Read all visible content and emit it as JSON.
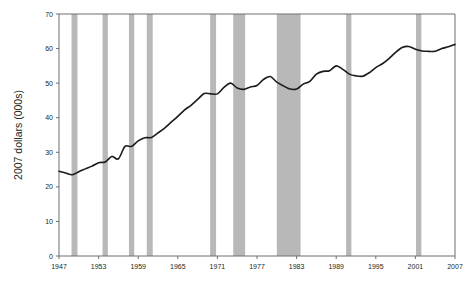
{
  "chart_data": {
    "type": "line",
    "title": "",
    "subtitle": "",
    "xlabel": "",
    "ylabel": "2007 dollars (000s)",
    "xlim": [
      1947,
      2007
    ],
    "ylim": [
      0,
      70
    ],
    "ytick_labels": [
      "0",
      "10",
      "20",
      "30",
      "40",
      "50",
      "60",
      "70"
    ],
    "yticks": [
      0,
      10,
      20,
      30,
      40,
      50,
      60,
      70
    ],
    "xtick_labels": [
      "1947",
      "1953",
      "1959",
      "1965",
      "1971",
      "1977",
      "1983",
      "1989",
      "1995",
      "2001",
      "2007"
    ],
    "xticks": [
      1947,
      1953,
      1959,
      1965,
      1971,
      1977,
      1983,
      1989,
      1995,
      2001,
      2007
    ],
    "grid": false,
    "legend": null,
    "line_color": "#1a1a1a",
    "band_color": "#b8b8b8",
    "axis_color": "#6d6e71",
    "series": [
      {
        "name": "Median household income",
        "x": [
          1947,
          1948,
          1949,
          1950,
          1951,
          1952,
          1953,
          1954,
          1955,
          1956,
          1957,
          1958,
          1959,
          1960,
          1961,
          1962,
          1963,
          1964,
          1965,
          1966,
          1967,
          1968,
          1969,
          1970,
          1971,
          1972,
          1973,
          1974,
          1975,
          1976,
          1977,
          1978,
          1979,
          1980,
          1981,
          1982,
          1983,
          1984,
          1985,
          1986,
          1987,
          1988,
          1989,
          1990,
          1991,
          1992,
          1993,
          1994,
          1995,
          1996,
          1997,
          1998,
          1999,
          2000,
          2001,
          2002,
          2003,
          2004,
          2005,
          2006,
          2007
        ],
        "values": [
          24.5,
          24.0,
          23.5,
          24.4,
          25.2,
          26.0,
          27.0,
          27.2,
          28.8,
          28.1,
          31.7,
          31.7,
          33.3,
          34.2,
          34.3,
          35.6,
          37.0,
          38.7,
          40.4,
          42.2,
          43.6,
          45.3,
          47.0,
          46.9,
          46.9,
          48.8,
          50.0,
          48.6,
          48.2,
          48.9,
          49.3,
          51.1,
          51.9,
          50.3,
          49.2,
          48.3,
          48.3,
          49.7,
          50.5,
          52.6,
          53.4,
          53.6,
          55.0,
          54.0,
          52.6,
          52.1,
          52.0,
          53.0,
          54.5,
          55.6,
          57.1,
          58.9,
          60.3,
          60.6,
          59.8,
          59.3,
          59.2,
          59.2,
          60.0,
          60.5,
          61.2
        ]
      }
    ],
    "recession_bands": [
      {
        "start": 1948.9,
        "end": 1949.8
      },
      {
        "start": 1953.6,
        "end": 1954.4
      },
      {
        "start": 1957.6,
        "end": 1958.4
      },
      {
        "start": 1960.3,
        "end": 1961.2
      },
      {
        "start": 1969.9,
        "end": 1970.8
      },
      {
        "start": 1973.4,
        "end": 1975.2
      },
      {
        "start": 1980.0,
        "end": 1983.6
      },
      {
        "start": 1990.5,
        "end": 1991.3
      },
      {
        "start": 2001.1,
        "end": 2001.9
      }
    ]
  }
}
